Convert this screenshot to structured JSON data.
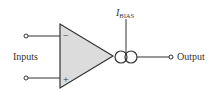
{
  "diagram": {
    "type": "op-amp symbol with bias current source (OTA)",
    "inputs_label": "Inputs",
    "inverting_sign": "−",
    "noninverting_sign": "+",
    "bias_label_main": "I",
    "bias_label_sub": "BIAS",
    "output_label": "Output",
    "colors": {
      "stroke": "#333333",
      "triangle_fill": "#dcdcdc",
      "background": "#ffffff"
    }
  }
}
